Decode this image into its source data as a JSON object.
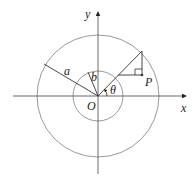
{
  "diagram": {
    "title": "",
    "labels": {
      "y_axis": "y",
      "x_axis": "x",
      "outer_radius": "a",
      "inner_radius": "b",
      "origin": "O",
      "angle": "θ",
      "point": "P"
    },
    "colors": {
      "circle": "#9a9a9a",
      "axis": "#444444",
      "line": "#333333",
      "background": "#ffffff"
    },
    "geometry": {
      "origin": [
        98,
        96
      ],
      "outer_radius_px": 61,
      "inner_radius_px": 25,
      "angle_deg": 45
    }
  }
}
